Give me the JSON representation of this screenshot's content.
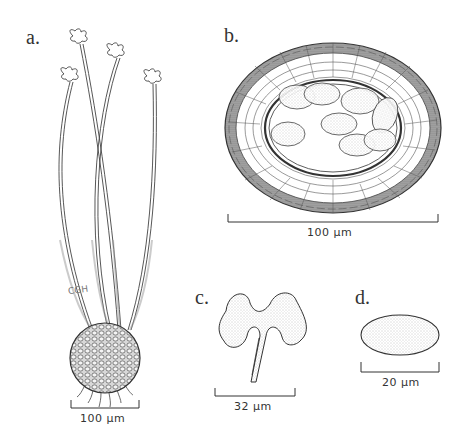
{
  "figure": {
    "panels": [
      {
        "id": "a",
        "label": "a.",
        "subject": "whole fruiting body: spherical base with four long stalks bearing lobed tips",
        "scale_label": "100 µm"
      },
      {
        "id": "b",
        "label": "b.",
        "subject": "cross-section: oval cellular wall layers enclosing stippled oval spores",
        "scale_label": "100 µm"
      },
      {
        "id": "c",
        "label": "c.",
        "subject": "lobed stalk tip (appendage)",
        "scale_label": "32 µm"
      },
      {
        "id": "d",
        "label": "d.",
        "subject": "single oval stippled spore",
        "scale_label": "20 µm"
      }
    ],
    "artist_initials": "CGH",
    "colors": {
      "ink": "#333333",
      "stipple": "#b8b8b8",
      "dark_cells": "#8a8a8a",
      "background": "#ffffff"
    }
  }
}
